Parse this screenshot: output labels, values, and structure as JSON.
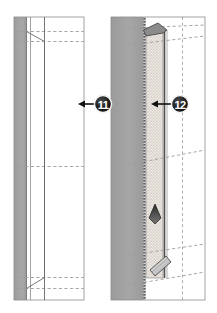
{
  "figure": {
    "type": "technical-cross-section",
    "background_color": "#ffffff",
    "panel_count": 2
  },
  "colors": {
    "wall_gray": "#a3a3a3",
    "wall_gray_dark": "#8f8f8f",
    "wall_gray_light": "#b8b8b8",
    "insulation_fill": "#ebe7e0",
    "insulation_dot": "#9a958c",
    "outline": "#555555",
    "dashed_line": "#9a9a9a",
    "badge_fill": "#1c1c1c",
    "badge_ring": "#ffffff",
    "badge_text": "#ffffff",
    "arrow": "#111111",
    "white": "#ffffff"
  },
  "panels": [
    {
      "id": "panel-left",
      "name": "left-section",
      "label": "Existing wall section",
      "x": 14,
      "y": 17,
      "width": 70,
      "height": 283,
      "regions": [
        {
          "name": "masonry-band",
          "fill": "#a3a3a3",
          "x": 14,
          "width": 12
        },
        {
          "name": "air-gap",
          "fill": "#ffffff",
          "x": 26,
          "width": 5
        },
        {
          "name": "interior-face",
          "fill": "#ffffff",
          "x": 31,
          "width": 53
        }
      ],
      "dashed_horizontals": [
        31,
        41,
        166,
        277,
        288
      ],
      "dashed_verticals": [
        44
      ]
    },
    {
      "id": "panel-right",
      "name": "right-section",
      "label": "Retrofit wall section with insulation",
      "x": 111,
      "y": 17,
      "width": 94,
      "height": 283,
      "regions": [
        {
          "name": "masonry-band",
          "fill": "#a3a3a3",
          "x": 111,
          "width": 33
        },
        {
          "name": "dotted-membrane",
          "fill": "#6d6d6d",
          "x": 144,
          "width": 2
        },
        {
          "name": "insulation-layer",
          "fill": "#ebe7e0",
          "x": 146,
          "width": 17
        },
        {
          "name": "interior-face",
          "fill": "#ffffff",
          "x": 166,
          "width": 39
        }
      ],
      "dashed_horizontals": [
        28,
        46,
        168,
        252,
        282
      ],
      "dashed_verticals": [
        182
      ]
    }
  ],
  "callouts": [
    {
      "id": "callout-11",
      "name": "callout-badge-11",
      "label": "11",
      "cx": 103,
      "cy": 104,
      "r": 9,
      "arrow": {
        "from_x": 94,
        "from_y": 104,
        "to_x": 79,
        "to_y": 104,
        "direction": "left"
      },
      "describes": "Existing wall assembly"
    },
    {
      "id": "callout-12",
      "name": "callout-badge-12",
      "label": "12",
      "cx": 180,
      "cy": 104,
      "r": 9,
      "arrow": {
        "from_x": 171,
        "from_y": 104,
        "to_x": 155,
        "to_y": 104,
        "direction": "left"
      },
      "describes": "New insulation layer"
    }
  ],
  "markers": [
    {
      "id": "marker-up-arrow",
      "name": "direction-arrow-marker",
      "shape": "up-arrow-diamond",
      "x": 155,
      "y": 214,
      "describes": "Airflow / installation direction within cavity"
    },
    {
      "id": "marker-bracket",
      "name": "angled-bracket-fixing",
      "shape": "angled-clip",
      "x": 158,
      "y": 268,
      "describes": "Angled fixing bracket at base of cavity"
    }
  ]
}
